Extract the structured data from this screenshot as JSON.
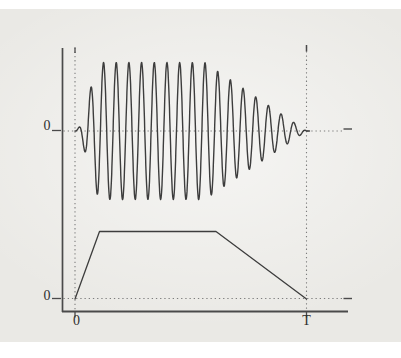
{
  "figure": {
    "kind": "textbook-figure-amplitude-modulated-burst-with-envelope",
    "labels": {
      "wave_zero": "0",
      "envelope_zero": "0",
      "time_origin": "0",
      "time_end": "T"
    },
    "colors": {
      "paper": "#eae9e5",
      "ink": "#3d3d3d",
      "axis": "#4a4a4a",
      "dotted": "#7d7d7d",
      "label": "#2f2f2f"
    }
  },
  "chart_data": {
    "type": "line",
    "title": "",
    "legend": "none",
    "grid": "dotted-reference-lines-only",
    "x_domain": [
      0,
      1
    ],
    "x_tick_labels": [
      "0",
      "T"
    ],
    "panels": [
      {
        "name": "modulated-oscillation",
        "baseline_label": "0",
        "y_range": [
          -1,
          1
        ],
        "series": {
          "name": "am-burst-waveform",
          "kind": "sinusoid-with-envelope",
          "carrier_cycles": 18.25,
          "peak_amplitude": 1,
          "tail_to_t": 1.013,
          "envelope": {
            "rise": {
              "from_t": 0,
              "to_t": 0.116,
              "shape": "smoothstep"
            },
            "flat": {
              "from_t": 0.116,
              "to_t": 0.56,
              "value": 1
            },
            "decay": {
              "from_t": 0.56,
              "to_t": 1,
              "shape": "linear"
            }
          }
        }
      },
      {
        "name": "envelope-function",
        "baseline_label": "0",
        "y_range": [
          0,
          1
        ],
        "series": {
          "name": "trapezoid-envelope",
          "kind": "piecewise-linear",
          "points": [
            [
              0,
              0
            ],
            [
              0.106,
              1
            ],
            [
              0.609,
              1
            ],
            [
              1,
              0
            ]
          ]
        }
      }
    ],
    "reference_lines": {
      "vertical_dotted_t": [
        0,
        1
      ],
      "horizontal_dotted": [
        "wave-baseline",
        "envelope-baseline"
      ],
      "right_end_dash": true,
      "left_zero_ticks": true
    }
  }
}
